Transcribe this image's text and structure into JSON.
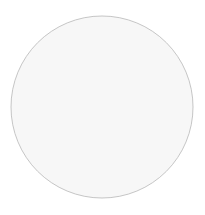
{
  "diagram": {
    "type": "quilt-pattern",
    "pattern_name": "double-wedding-ring-circle",
    "canvas": {
      "width": 205,
      "height": 215,
      "background": "#ffffff"
    },
    "circle": {
      "cx": 102,
      "cy": 107,
      "r": 91
    },
    "colors": {
      "outline": "#b8b8b8",
      "stitch": "#9a9a9a",
      "segment_dark": "#c8c8c8",
      "segment_mid": "#dedede",
      "segment_light": "#efefef",
      "melon_fill": "#f7f7f7",
      "center_fill": "#ffffff"
    },
    "rings": [
      {
        "name": "top",
        "cx": 102,
        "cy": -28,
        "r_outer": 152,
        "r_inner": 138
      },
      {
        "name": "bottom",
        "cx": 102,
        "cy": 242,
        "r_outer": 152,
        "r_inner": 138
      },
      {
        "name": "left",
        "cx": -33,
        "cy": 107,
        "r_outer": 152,
        "r_inner": 138
      },
      {
        "name": "right",
        "cx": 237,
        "cy": 107,
        "r_outer": 152,
        "r_inner": 138
      }
    ],
    "center_flower": {
      "cx": 102,
      "cy": 107,
      "petals": 4,
      "petal_length": 40
    }
  }
}
